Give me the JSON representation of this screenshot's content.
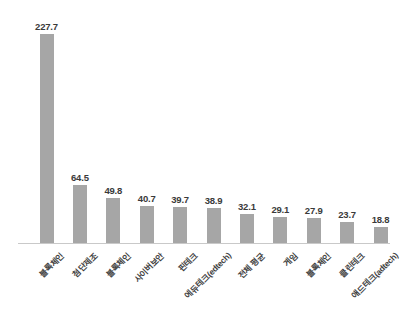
{
  "chart_data": {
    "type": "bar",
    "title": "",
    "subtitle": "",
    "xlabel": "",
    "ylabel": "",
    "grid": false,
    "legend": false,
    "ylim": [
      0,
      240
    ],
    "bar_color": "#a6a6a6",
    "background_color": "#ffffff",
    "axis_color": "#c9c9c9",
    "label_color": "#3a3a3a",
    "label_rotation_deg": -45,
    "categories": [
      "블록체인",
      "첨단제조",
      "블록체인",
      "사이버보안",
      "핀테크",
      "에듀테크(edtech)",
      "전체 평균",
      "게임",
      "블록체인",
      "클린테크",
      "애드테크(adtech)"
    ],
    "values": [
      227.7,
      64.5,
      49.8,
      40.7,
      39.7,
      38.9,
      32.1,
      29.1,
      27.9,
      23.7,
      18.8
    ],
    "value_labels": [
      "227.7",
      "64.5",
      "49.8",
      "40.7",
      "39.7",
      "38.9",
      "32.1",
      "29.1",
      "27.9",
      "23.7",
      "18.8"
    ]
  }
}
